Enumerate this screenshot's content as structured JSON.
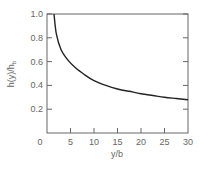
{
  "chart_data": {
    "type": "line",
    "title": "",
    "xlabel": "y/b",
    "ylabel": "h(y)/h_b",
    "xlim": [
      0,
      30
    ],
    "ylim": [
      0,
      1.0
    ],
    "grid": false,
    "legend": null,
    "x_ticks": [
      "0",
      "5",
      "10",
      "15",
      "20",
      "25",
      "30"
    ],
    "y_ticks": [
      "0.2",
      "0.4",
      "0.6",
      "0.8",
      "1.0"
    ],
    "series": [
      {
        "name": "h(y)/h_b",
        "x": [
          1.5,
          2.0,
          3.0,
          4.5,
          6.0,
          8.0,
          10.0,
          12.5,
          15.0,
          17.5,
          20.0,
          22.5,
          25.0,
          27.5,
          30.0
        ],
        "y": [
          1.0,
          0.83,
          0.7,
          0.61,
          0.55,
          0.49,
          0.44,
          0.4,
          0.37,
          0.35,
          0.33,
          0.315,
          0.3,
          0.29,
          0.28
        ]
      }
    ]
  },
  "labels": {
    "xlabel": "y/b",
    "ylabel_main": "h(y)/h",
    "ylabel_sub": "b"
  }
}
